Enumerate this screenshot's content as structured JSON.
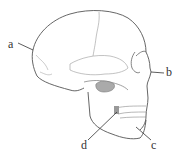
{
  "diagram": {
    "labels": [
      {
        "id": "a",
        "text": "a",
        "x": 8,
        "y": 38
      },
      {
        "id": "b",
        "text": "b",
        "x": 166,
        "y": 66
      },
      {
        "id": "c",
        "text": "c",
        "x": 151,
        "y": 139
      },
      {
        "id": "d",
        "text": "d",
        "x": 81,
        "y": 139
      }
    ],
    "colors": {
      "outline": "#555555",
      "suture": "#888888",
      "shading": "#aaaaaa",
      "label": "#333333"
    }
  }
}
